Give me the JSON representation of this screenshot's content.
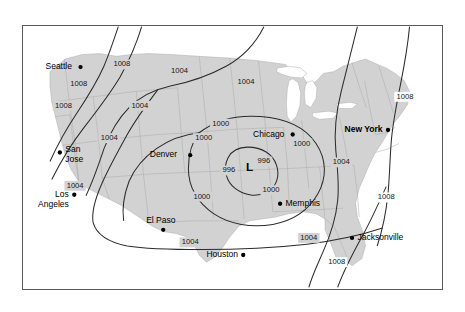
{
  "figure": {
    "title": "",
    "frame": {
      "border_color": "#5a5a5a",
      "background": "#ffffff"
    },
    "land_color": "#d2d2d2",
    "water_color": "#ffffff",
    "isobar_color": "#2b2b2b"
  },
  "chart_data": {
    "type": "map",
    "subtype": "surface-pressure-isobar-map",
    "title": "",
    "units": "millibars",
    "grid": false,
    "legend": "none",
    "pressure_center": {
      "symbol": "L",
      "kind": "low",
      "label": "L",
      "central_pressure": 996,
      "x": 252,
      "y": 157
    },
    "isobar_values": [
      996,
      1000,
      1004,
      1008
    ],
    "isobar_labels": [
      {
        "value": "1008",
        "x": 110,
        "y": 42
      },
      {
        "value": "1008",
        "x": 62,
        "y": 64
      },
      {
        "value": "1008",
        "x": 45,
        "y": 88
      },
      {
        "value": "1004",
        "x": 174,
        "y": 49
      },
      {
        "value": "1004",
        "x": 248,
        "y": 62
      },
      {
        "value": "1004",
        "x": 130,
        "y": 88
      },
      {
        "value": "1004",
        "x": 96,
        "y": 124
      },
      {
        "value": "1004",
        "x": 58,
        "y": 177
      },
      {
        "value": "1000",
        "x": 220,
        "y": 108
      },
      {
        "value": "1000",
        "x": 201,
        "y": 124
      },
      {
        "value": "1000",
        "x": 310,
        "y": 130
      },
      {
        "value": "996",
        "x": 229,
        "y": 160
      },
      {
        "value": "996",
        "x": 268,
        "y": 150
      },
      {
        "value": "1000",
        "x": 199,
        "y": 189
      },
      {
        "value": "1000",
        "x": 276,
        "y": 182
      },
      {
        "value": "1004",
        "x": 354,
        "y": 151
      },
      {
        "value": "1008",
        "x": 425,
        "y": 78
      },
      {
        "value": "1008",
        "x": 404,
        "y": 190
      },
      {
        "value": "1004",
        "x": 186,
        "y": 240
      },
      {
        "value": "1004",
        "x": 318,
        "y": 235
      },
      {
        "value": "1008",
        "x": 349,
        "y": 262
      }
    ],
    "cities": [
      {
        "name": "Seattle",
        "dot_x": 64,
        "dot_y": 45,
        "label_x": 25,
        "label_y": 45,
        "anchor": "start",
        "bold": false,
        "lines": [
          "Seattle"
        ]
      },
      {
        "name": "San Jose",
        "dot_x": 41,
        "dot_y": 140,
        "label_x": 47,
        "label_y": 137,
        "anchor": "start",
        "bold": false,
        "lines": [
          "San",
          "Jose"
        ]
      },
      {
        "name": "Los Angeles",
        "dot_x": 57,
        "dot_y": 187,
        "label_x": 51,
        "label_y": 187,
        "anchor": "end",
        "bold": false,
        "lines": [
          "Los",
          "Angeles"
        ]
      },
      {
        "name": "Denver",
        "dot_x": 186,
        "dot_y": 143,
        "label_x": 141,
        "label_y": 143,
        "anchor": "start",
        "bold": false,
        "lines": [
          "Denver"
        ]
      },
      {
        "name": "El Paso",
        "dot_x": 156,
        "dot_y": 226,
        "label_x": 137,
        "label_y": 216,
        "anchor": "start",
        "bold": false,
        "lines": [
          "El Paso"
        ]
      },
      {
        "name": "Houston",
        "dot_x": 245,
        "dot_y": 254,
        "label_x": 204,
        "label_y": 254,
        "anchor": "start",
        "bold": false,
        "lines": [
          "Houston"
        ]
      },
      {
        "name": "Chicago",
        "dot_x": 300,
        "dot_y": 120,
        "label_x": 256,
        "label_y": 120,
        "anchor": "start",
        "bold": false,
        "lines": [
          "Chicago"
        ]
      },
      {
        "name": "Memphis",
        "dot_x": 286,
        "dot_y": 197,
        "label_x": 292,
        "label_y": 197,
        "anchor": "start",
        "bold": false,
        "lines": [
          "Memphis"
        ]
      },
      {
        "name": "New York",
        "dot_x": 406,
        "dot_y": 115,
        "label_x": 400,
        "label_y": 115,
        "anchor": "end",
        "bold": true,
        "lines": [
          "New York"
        ]
      },
      {
        "name": "Jacksonville",
        "dot_x": 366,
        "dot_y": 235,
        "label_x": 372,
        "label_y": 235,
        "anchor": "start",
        "bold": false,
        "lines": [
          "Jacksonville"
        ]
      }
    ]
  }
}
